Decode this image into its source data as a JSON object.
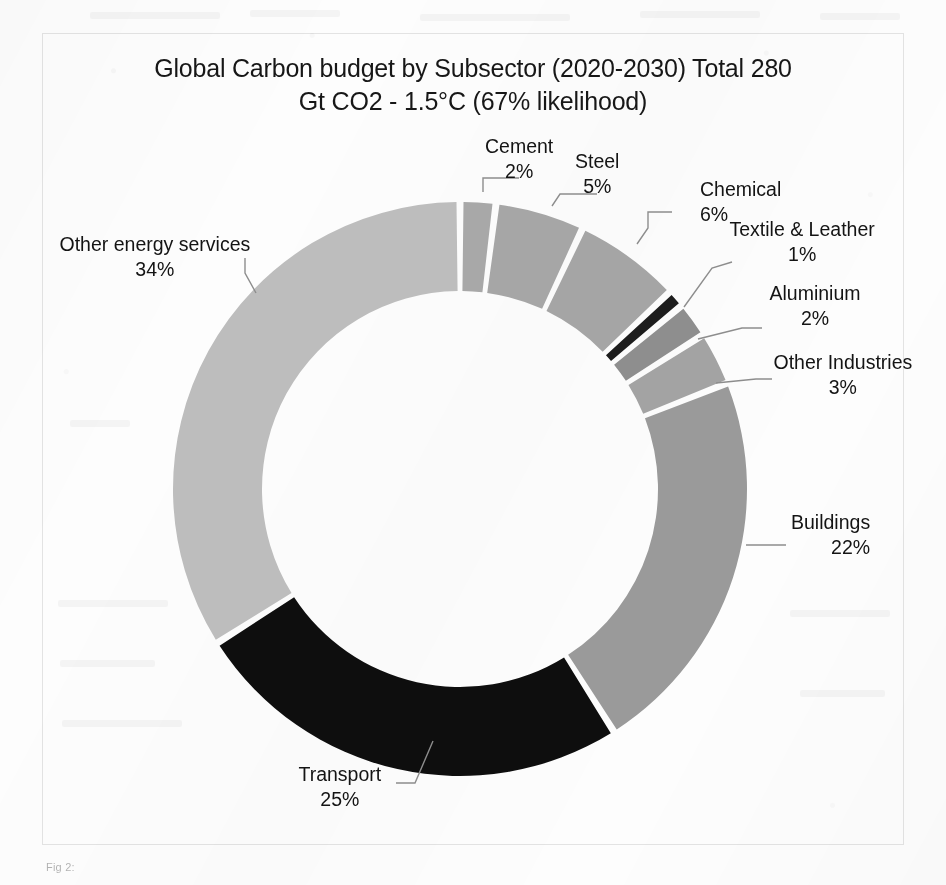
{
  "document": {
    "caption": "Fig 2:"
  },
  "chart": {
    "title_line1": "Global Carbon budget by Subsector (2020-2030) Total 280",
    "title_line2": "Gt CO2 - 1.5°C (67% likelihood)",
    "geometry": {
      "cx": 460,
      "cy": 489,
      "outer_r": 287,
      "inner_r": 198,
      "start_angle_deg": -90,
      "gap_deg": 1.4
    }
  },
  "chart_data": {
    "type": "pie",
    "title": "Global Carbon budget by Subsector (2020-2030) Total 280 Gt CO2 - 1.5°C (67% likelihood)",
    "subtitle": "",
    "xlabel": "",
    "ylabel": "",
    "donut": true,
    "total_label": "Total 280 Gt CO2",
    "legend_position": "none (direct labels with leader lines)",
    "grid": false,
    "units": "percent of total carbon budget",
    "categories": [
      "Cement",
      "Steel",
      "Chemical",
      "Textile & Leather",
      "Aluminium",
      "Other Industries",
      "Buildings",
      "Transport",
      "Other energy services"
    ],
    "values": [
      2,
      5,
      6,
      1,
      2,
      3,
      22,
      25,
      34
    ],
    "labels": [
      "2%",
      "5%",
      "6%",
      "1%",
      "2%",
      "3%",
      "22%",
      "25%",
      "34%"
    ],
    "colors": [
      "#a8a8a8",
      "#a6a6a6",
      "#a5a5a5",
      "#1d1d1d",
      "#8e8e8e",
      "#a3a3a3",
      "#9a9a9a",
      "#0e0e0e",
      "#bdbdbd"
    ],
    "slices": [
      {
        "name": "Cement",
        "value": 2,
        "label": "2%",
        "color": "#a8a8a8",
        "label_x": 519,
        "label_y": 148,
        "align": "center",
        "leader": "M 483,192 L 483,178 L 519,178"
      },
      {
        "name": "Steel",
        "value": 5,
        "label": "5%",
        "color": "#a6a6a6",
        "label_x": 597,
        "label_y": 163,
        "align": "center",
        "leader": "M 552,206 L 560,194 L 597,194"
      },
      {
        "name": "Chemical",
        "value": 6,
        "label": "6%",
        "color": "#a5a5a5",
        "label_x": 700,
        "label_y": 191,
        "align": "left",
        "leader": "M 637,244 L 648,228 L 648,212 L 672,212"
      },
      {
        "name": "Textile & Leather",
        "value": 1,
        "label": "1%",
        "color": "#1d1d1d",
        "label_x": 802,
        "label_y": 231,
        "align": "center",
        "leader": "M 684,307 L 712,268 L 732,262"
      },
      {
        "name": "Aluminium",
        "value": 2,
        "label": "2%",
        "color": "#8e8e8e",
        "label_x": 815,
        "label_y": 295,
        "align": "center",
        "leader": "M 698,339 L 742,328 L 762,328"
      },
      {
        "name": "Other Industries",
        "value": 3,
        "label": "3%",
        "color": "#a3a3a3",
        "label_x": 843,
        "label_y": 364,
        "align": "center",
        "leader": "M 716,383 L 756,379 L 772,379"
      },
      {
        "name": "Buildings",
        "value": 22,
        "label": "22%",
        "color": "#9a9a9a",
        "label_x": 870,
        "label_y": 524,
        "align": "right",
        "leader": "M 746,545 L 786,545"
      },
      {
        "name": "Transport",
        "value": 25,
        "label": "25%",
        "color": "#0e0e0e",
        "label_x": 340,
        "label_y": 776,
        "align": "center",
        "leader": "M 433,741 L 415,783 L 396,783"
      },
      {
        "name": "Other energy services",
        "value": 34,
        "label": "34%",
        "color": "#bdbdbd",
        "label_x": 155,
        "label_y": 246,
        "align": "center",
        "leader": "M 256,293 L 245,273 L 245,258"
      }
    ]
  }
}
